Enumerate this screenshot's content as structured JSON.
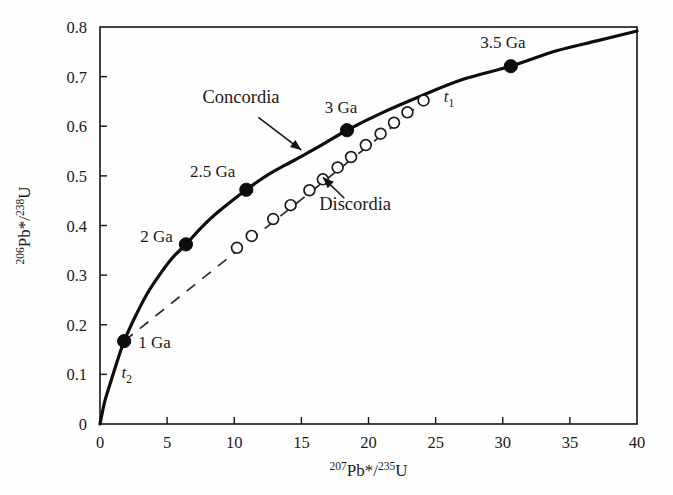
{
  "chart_data": {
    "type": "scatter",
    "title": "",
    "xlabel": "207Pb*/235U",
    "ylabel": "206Pb*/238U",
    "xlabel_parts": {
      "sup1": "207",
      "mid": "Pb*/",
      "sup2": "235",
      "tail": "U"
    },
    "ylabel_parts": {
      "sup1": "206",
      "mid": "Pb*/",
      "sup2": "238",
      "tail": "U"
    },
    "xlim": [
      0,
      40
    ],
    "ylim": [
      0,
      0.8
    ],
    "xticks": [
      0,
      5,
      10,
      15,
      20,
      25,
      30,
      35,
      40
    ],
    "xtick_labels": [
      "0",
      "5",
      "10",
      "15",
      "20",
      "25",
      "30",
      "35",
      "40"
    ],
    "yticks": [
      0,
      0.1,
      0.2,
      0.3,
      0.4,
      0.5,
      0.6,
      0.7,
      0.8
    ],
    "ytick_labels": [
      "0",
      "0.1",
      "0.2",
      "0.3",
      "0.4",
      "0.5",
      "0.6",
      "0.7",
      "0.8"
    ],
    "grid": false,
    "legend": "none",
    "series": [
      {
        "name": "Concordia",
        "style": "solid-curve",
        "points": [
          [
            0,
            0
          ],
          [
            0.35,
            0.045
          ],
          [
            0.8,
            0.085
          ],
          [
            1.35,
            0.132
          ],
          [
            1.8,
            0.167
          ],
          [
            2.6,
            0.215
          ],
          [
            3.5,
            0.262
          ],
          [
            4.5,
            0.303
          ],
          [
            5.4,
            0.335
          ],
          [
            6.4,
            0.362
          ],
          [
            7.6,
            0.397
          ],
          [
            8.7,
            0.425
          ],
          [
            10.9,
            0.472
          ],
          [
            12.5,
            0.502
          ],
          [
            14.5,
            0.532
          ],
          [
            16.5,
            0.562
          ],
          [
            18.4,
            0.592
          ],
          [
            21.0,
            0.627
          ],
          [
            24.0,
            0.662
          ],
          [
            27.0,
            0.694
          ],
          [
            30.6,
            0.721
          ],
          [
            34.0,
            0.752
          ],
          [
            37.0,
            0.772
          ],
          [
            40.0,
            0.792
          ]
        ]
      },
      {
        "name": "Discordia",
        "style": "dashed-line",
        "points": [
          [
            1.8,
            0.167
          ],
          [
            24.4,
            0.656
          ]
        ]
      }
    ],
    "concordia_age_points": [
      {
        "label": "1 Ga",
        "x": 1.8,
        "y": 0.167
      },
      {
        "label": "2 Ga",
        "x": 6.4,
        "y": 0.362
      },
      {
        "label": "2.5 Ga",
        "x": 10.9,
        "y": 0.472
      },
      {
        "label": "3 Ga",
        "x": 18.4,
        "y": 0.592
      },
      {
        "label": "3.5 Ga",
        "x": 30.6,
        "y": 0.721
      }
    ],
    "discordia_sample_points": [
      {
        "x": 10.2,
        "y": 0.355
      },
      {
        "x": 11.3,
        "y": 0.379
      },
      {
        "x": 12.9,
        "y": 0.413
      },
      {
        "x": 14.2,
        "y": 0.441
      },
      {
        "x": 15.6,
        "y": 0.471
      },
      {
        "x": 16.6,
        "y": 0.493
      },
      {
        "x": 17.7,
        "y": 0.517
      },
      {
        "x": 18.7,
        "y": 0.538
      },
      {
        "x": 19.8,
        "y": 0.562
      },
      {
        "x": 20.9,
        "y": 0.585
      },
      {
        "x": 21.9,
        "y": 0.607
      },
      {
        "x": 22.9,
        "y": 0.628
      },
      {
        "x": 24.1,
        "y": 0.652
      }
    ],
    "annotations": [
      {
        "text": "Concordia",
        "label_x": 10.5,
        "label_y": 0.646,
        "arrow_from": [
          11.8,
          0.618
        ],
        "arrow_to": [
          15.0,
          0.552
        ]
      },
      {
        "text": "Discordia",
        "label_x": 19.0,
        "label_y": 0.432,
        "arrow_from": [
          18.2,
          0.455
        ],
        "arrow_to": [
          16.6,
          0.497
        ]
      },
      {
        "text": "t1",
        "label_x": 25.6,
        "label_y": 0.648,
        "base": "t",
        "sub": "1"
      },
      {
        "text": "t2",
        "label_x": 1.6,
        "label_y": 0.092,
        "base": "t",
        "sub": "2"
      }
    ]
  }
}
